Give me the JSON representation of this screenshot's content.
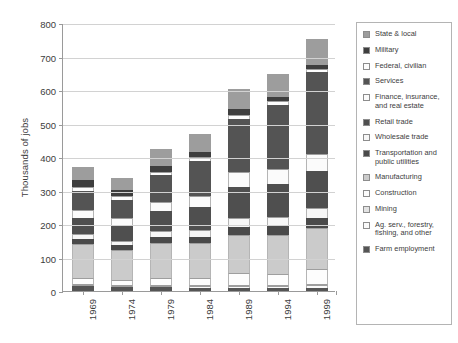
{
  "chart_data": {
    "type": "bar",
    "subtype": "stacked-vertical",
    "title": "",
    "xlabel": "",
    "ylabel": "Thousands of jobs",
    "categories": [
      "1969",
      "1974",
      "1979",
      "1984",
      "1989",
      "1994",
      "1999"
    ],
    "ylim": [
      0,
      800
    ],
    "ytick_values": [
      0,
      100,
      200,
      300,
      400,
      500,
      600,
      700,
      800
    ],
    "ytick_labels": [
      "0",
      "100",
      "200",
      "300",
      "400",
      "500",
      "600",
      "700",
      "800"
    ],
    "grid": true,
    "legend_position": "right",
    "totals": [
      370,
      337,
      424,
      470,
      603,
      648,
      752
    ],
    "series": [
      {
        "name": "Farm employment",
        "color": "#555555",
        "values": [
          14,
          12,
          11,
          10,
          9,
          8,
          8
        ]
      },
      {
        "name": "Ag. serv., forestry, fishing, and other",
        "color": "#fafafa",
        "values": [
          3,
          3,
          4,
          5,
          7,
          8,
          10
        ]
      },
      {
        "name": "Mining",
        "color": "#e3e3e3",
        "values": [
          2,
          2,
          3,
          3,
          2,
          2,
          2
        ]
      },
      {
        "name": "Construction",
        "color": "#fdfdfd",
        "values": [
          18,
          15,
          21,
          22,
          34,
          33,
          44
        ]
      },
      {
        "name": "Manufacturing",
        "color": "#cbcbcb",
        "values": [
          101,
          90,
          103,
          102,
          115,
          116,
          123
        ]
      },
      {
        "name": "Transportation and public utilities",
        "color": "#4a4a4a",
        "values": [
          15,
          14,
          18,
          19,
          24,
          26,
          30
        ]
      },
      {
        "name": "Wholesale trade",
        "color": "#f7f7f7",
        "values": [
          15,
          13,
          18,
          20,
          26,
          26,
          29
        ]
      },
      {
        "name": "Retail trade",
        "color": "#4f4f4f",
        "values": [
          50,
          47,
          61,
          70,
          92,
          99,
          111
        ]
      },
      {
        "name": "Finance, insurance, and real estate",
        "color": "#fbfbfb",
        "values": [
          22,
          21,
          28,
          33,
          44,
          45,
          50
        ]
      },
      {
        "name": "Services",
        "color": "#545454",
        "values": [
          58,
          55,
          79,
          103,
          161,
          191,
          245
        ]
      },
      {
        "name": "Federal, civilian",
        "color": "#fdfdfd",
        "values": [
          12,
          11,
          11,
          12,
          12,
          12,
          11
        ]
      },
      {
        "name": "Military",
        "color": "#3e3e3e",
        "values": [
          22,
          18,
          16,
          16,
          16,
          13,
          11
        ]
      },
      {
        "name": "State & local",
        "color": "#9d9d9d",
        "values": [
          38,
          36,
          51,
          55,
          61,
          69,
          78
        ]
      }
    ]
  },
  "legend": {
    "items": [
      {
        "label": "State & local",
        "color": "#9d9d9d"
      },
      {
        "label": "Military",
        "color": "#3e3e3e"
      },
      {
        "label": "Federal, civilian",
        "color": "#fdfdfd"
      },
      {
        "label": "Services",
        "color": "#545454"
      },
      {
        "label": "Finance, insurance, and real estate",
        "color": "#fbfbfb"
      },
      {
        "label": "Retail trade",
        "color": "#4f4f4f"
      },
      {
        "label": "Wholesale trade",
        "color": "#f7f7f7"
      },
      {
        "label": "Transportation and public utilities",
        "color": "#4a4a4a"
      },
      {
        "label": "Manufacturing",
        "color": "#cbcbcb"
      },
      {
        "label": "Construction",
        "color": "#fdfdfd"
      },
      {
        "label": "Mining",
        "color": "#e3e3e3"
      },
      {
        "label": "Ag. serv., forestry, fishing, and other",
        "color": "#fafafa"
      },
      {
        "label": "Farm employment",
        "color": "#555555"
      }
    ]
  },
  "colors": {
    "axis": "#9a9a9a",
    "grid": "#d2d2d2",
    "text": "#3c3c3c",
    "legend_border": "#b4b4b4",
    "background": "#ffffff"
  }
}
